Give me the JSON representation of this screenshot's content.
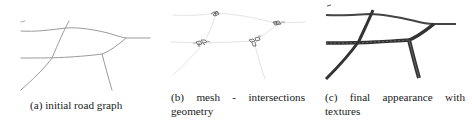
{
  "figure": {
    "panels": [
      {
        "id": "a",
        "label": "(a)",
        "caption": "(a) initial road graph",
        "caption_lines": [
          "(a) initial road graph"
        ],
        "style": "thin gray polyline road graph",
        "stroke_color": "#9a9a9a"
      },
      {
        "id": "b",
        "label": "(b)",
        "caption": "(b) mesh - intersections geometry",
        "caption_lines": [
          "(b)",
          "mesh",
          "-",
          "intersections",
          "geometry"
        ],
        "style": "faint road lines with small intersection mesh clusters",
        "stroke_color": "#e2e2e2",
        "cluster_color": "#555555"
      },
      {
        "id": "c",
        "label": "(c)",
        "caption": "(c) final appearance with textures",
        "caption_lines": [
          "(c)",
          "final",
          "appearance",
          "with",
          "textures"
        ],
        "style": "thick dark textured roads",
        "stroke_color": "#3a3a3a"
      }
    ]
  }
}
